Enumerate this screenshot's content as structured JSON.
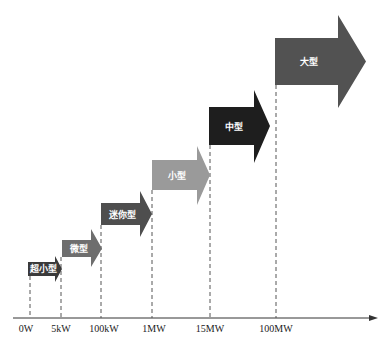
{
  "diagram": {
    "axis": {
      "ticks": [
        {
          "label": "0W"
        },
        {
          "label": "5kW"
        },
        {
          "label": "100kW"
        },
        {
          "label": "1MW"
        },
        {
          "label": "15MW"
        },
        {
          "label": "100MW"
        }
      ]
    },
    "categories": [
      {
        "label": "超小型",
        "color": "#3a3a3a",
        "text_color": "#ffffff"
      },
      {
        "label": "微型",
        "color": "#6e6e6e",
        "text_color": "#111111"
      },
      {
        "label": "迷你型",
        "color": "#4e4e4e",
        "text_color": "#ffffff"
      },
      {
        "label": "小型",
        "color": "#9a9a9a",
        "text_color": "#111111"
      },
      {
        "label": "中型",
        "color": "#1e1e1e",
        "text_color": "#ffffff"
      },
      {
        "label": "大型",
        "color": "#525252",
        "text_color": "#ffffff"
      }
    ]
  }
}
